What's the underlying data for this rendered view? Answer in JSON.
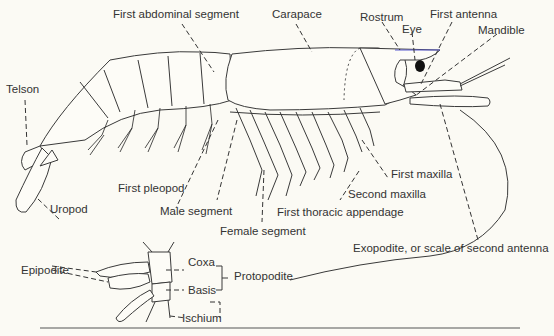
{
  "figure": {
    "colors": {
      "background": "#fbfaf4",
      "ink": "#333333",
      "eye": "#111111",
      "rostrum_accent": "#5a5ad0"
    },
    "labels": {
      "first_abdominal_segment": "First abdominal segment",
      "carapace": "Carapace",
      "rostrum": "Rostrum",
      "eye": "Eye",
      "first_antenna": "First antenna",
      "mandible": "Mandible",
      "telson": "Telson",
      "uropod": "Uropod",
      "first_pleopod": "First pleopod",
      "male_segment": "Male segment",
      "female_segment": "Female segment",
      "first_thoracic_appendage": "First thoracic appendage",
      "second_maxilla": "Second maxilla",
      "first_maxilla": "First maxilla",
      "exopodite_scale": "Exopodite, or scale of second antenna"
    },
    "inset": {
      "title": "Thoracic appendage base detail",
      "labels": {
        "epipodite": "Epipodite",
        "coxa": "Coxa",
        "basis": "Basis",
        "protopodite": "Protopodite",
        "ischium": "Ischium"
      }
    }
  }
}
